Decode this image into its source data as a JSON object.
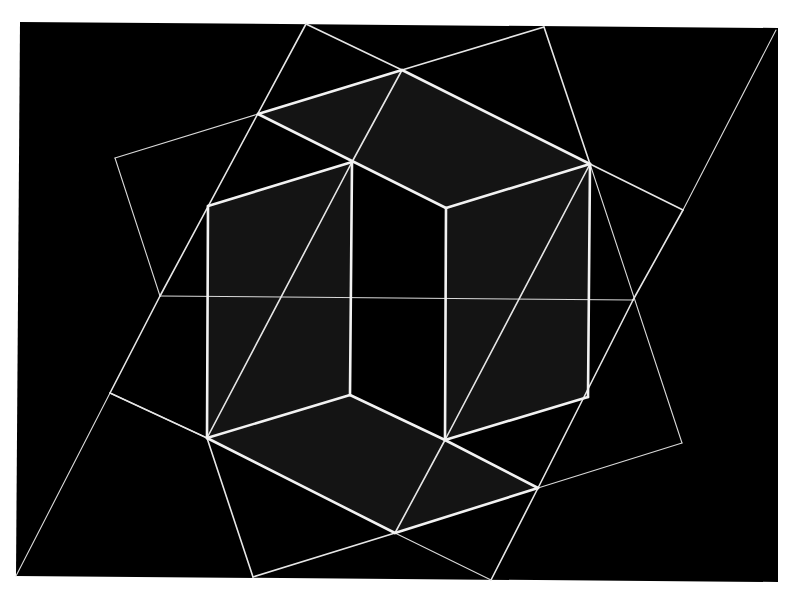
{
  "artwork": {
    "colors": {
      "page": "#ffffff",
      "panel": "#000000",
      "shaded_face": "#141414",
      "line": "#e8e8e8"
    },
    "panel": [
      [
        20,
        22
      ],
      [
        778,
        28
      ],
      [
        778,
        582
      ],
      [
        16,
        576
      ]
    ],
    "shaded_faces": [
      [
        [
          258,
          114
        ],
        [
          402,
          70
        ],
        [
          590,
          164
        ],
        [
          446,
          208
        ],
        [
          352,
          162
        ]
      ],
      [
        [
          208,
          206
        ],
        [
          352,
          162
        ],
        [
          350,
          395
        ],
        [
          207,
          438
        ]
      ],
      [
        [
          446,
          208
        ],
        [
          590,
          164
        ],
        [
          588,
          397
        ],
        [
          445,
          440
        ]
      ],
      [
        [
          207,
          438
        ],
        [
          350,
          395
        ],
        [
          445,
          440
        ],
        [
          538,
          488
        ],
        [
          395,
          533
        ]
      ]
    ],
    "bold_lines": [
      [
        [
          258,
          114
        ],
        [
          402,
          70
        ]
      ],
      [
        [
          402,
          70
        ],
        [
          590,
          164
        ]
      ],
      [
        [
          258,
          114
        ],
        [
          446,
          208
        ]
      ],
      [
        [
          446,
          208
        ],
        [
          590,
          164
        ]
      ],
      [
        [
          208,
          206
        ],
        [
          352,
          162
        ]
      ],
      [
        [
          352,
          162
        ],
        [
          350,
          395
        ]
      ],
      [
        [
          208,
          206
        ],
        [
          207,
          438
        ]
      ],
      [
        [
          207,
          438
        ],
        [
          350,
          395
        ]
      ],
      [
        [
          350,
          395
        ],
        [
          445,
          440
        ]
      ],
      [
        [
          446,
          208
        ],
        [
          445,
          440
        ]
      ],
      [
        [
          445,
          440
        ],
        [
          588,
          397
        ]
      ],
      [
        [
          590,
          164
        ],
        [
          588,
          397
        ]
      ],
      [
        [
          445,
          440
        ],
        [
          538,
          488
        ]
      ],
      [
        [
          207,
          438
        ],
        [
          395,
          533
        ]
      ],
      [
        [
          395,
          533
        ],
        [
          538,
          488
        ]
      ]
    ],
    "mid_lines": [
      [
        [
          306,
          24
        ],
        [
          160,
          296
        ]
      ],
      [
        [
          160,
          296
        ],
        [
          110,
          393
        ]
      ],
      [
        [
          110,
          393
        ],
        [
          207,
          438
        ]
      ],
      [
        [
          207,
          438
        ],
        [
          352,
          162
        ]
      ],
      [
        [
          352,
          162
        ],
        [
          402,
          70
        ]
      ],
      [
        [
          402,
          70
        ],
        [
          544,
          27
        ]
      ],
      [
        [
          306,
          24
        ],
        [
          402,
          70
        ]
      ],
      [
        [
          544,
          27
        ],
        [
          590,
          164
        ]
      ],
      [
        [
          590,
          164
        ],
        [
          683,
          210
        ]
      ],
      [
        [
          683,
          210
        ],
        [
          633,
          300
        ]
      ],
      [
        [
          633,
          300
        ],
        [
          538,
          488
        ]
      ],
      [
        [
          538,
          488
        ],
        [
          491,
          580
        ]
      ],
      [
        [
          590,
          164
        ],
        [
          445,
          440
        ]
      ],
      [
        [
          445,
          440
        ],
        [
          395,
          533
        ]
      ],
      [
        [
          395,
          533
        ],
        [
          253,
          577
        ]
      ],
      [
        [
          207,
          438
        ],
        [
          253,
          577
        ]
      ]
    ],
    "thin_lines": [
      [
        [
          258,
          114
        ],
        [
          115,
          158
        ]
      ],
      [
        [
          115,
          158
        ],
        [
          160,
          296
        ]
      ],
      [
        [
          160,
          296
        ],
        [
          633,
          300
        ]
      ],
      [
        [
          590,
          164
        ],
        [
          682,
          443
        ]
      ],
      [
        [
          682,
          443
        ],
        [
          538,
          488
        ]
      ],
      [
        [
          16,
          576
        ],
        [
          110,
          393
        ]
      ],
      [
        [
          683,
          210
        ],
        [
          776,
          30
        ]
      ],
      [
        [
          395,
          533
        ],
        [
          491,
          580
        ]
      ],
      [
        [
          110,
          393
        ],
        [
          207,
          438
        ]
      ]
    ]
  }
}
